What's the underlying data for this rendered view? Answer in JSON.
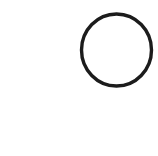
{
  "canvas": {
    "width": 158,
    "height": 156,
    "background": "#ffffff"
  },
  "shapes": [
    {
      "type": "circle",
      "name": "hand-drawn-circle",
      "cx": 116.5,
      "cy": 50,
      "r": 35,
      "stroke": "#1c1c1c",
      "stroke_width": 3.4,
      "fill": "none"
    }
  ]
}
